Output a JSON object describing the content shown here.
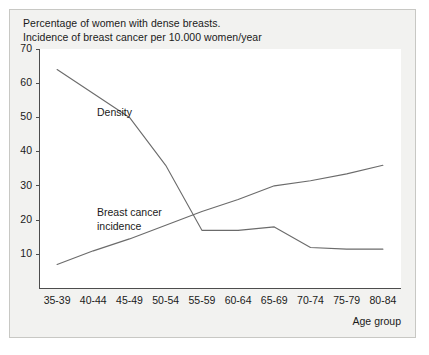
{
  "figure": {
    "caption_line_1": "Percentage of women with dense breasts.",
    "caption_line_2": "Incidence of breast cancer per 10.000 women/year",
    "axis_title_x": "Age group",
    "annotation_density": "Density",
    "annotation_incidence_line_1": "Breast cancer",
    "annotation_incidence_line_2": "incidence",
    "colors": {
      "line": "#6b6b6b",
      "axis": "#4d4d4d",
      "plot_background": "#ffffff",
      "figure_background": "#f2f2f0",
      "frame_border": "#c8c8c4",
      "text": "#1a1a1a"
    }
  },
  "chart_data": {
    "type": "line",
    "title": "Percentage of women with dense breasts. Incidence of breast cancer per 10.000 women/year",
    "xlabel": "Age group",
    "ylabel": "",
    "categories": [
      "35-39",
      "40-44",
      "45-49",
      "50-54",
      "55-59",
      "60-64",
      "65-69",
      "70-74",
      "75-79",
      "80-84"
    ],
    "ylim": [
      0,
      70
    ],
    "yticks": [
      10,
      20,
      30,
      40,
      50,
      60,
      70
    ],
    "ytick_labels": [
      "10",
      "20",
      "30",
      "40",
      "50",
      "60",
      "70"
    ],
    "grid": false,
    "legend": "inline-annotations",
    "series": [
      {
        "name": "Density",
        "values": [
          64,
          57,
          50,
          36,
          17,
          17,
          18,
          12,
          11.5,
          11.5
        ]
      },
      {
        "name": "Breast cancer incidence",
        "values": [
          7,
          11,
          14.5,
          18.5,
          22.5,
          26,
          30,
          31.5,
          33.5,
          36
        ]
      }
    ]
  }
}
